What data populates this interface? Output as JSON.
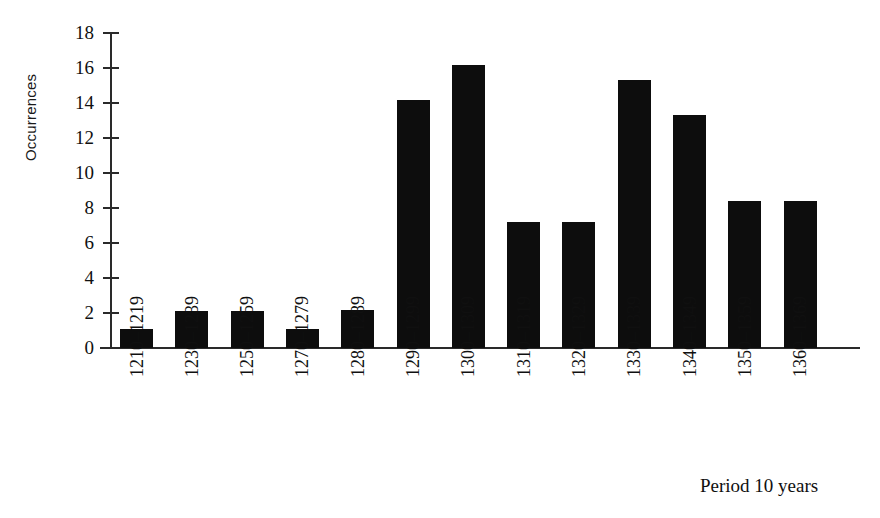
{
  "chart_data": {
    "type": "bar",
    "title": "",
    "xlabel": "Period 10 years",
    "ylabel": "Occurrences",
    "categories": [
      "1210–1219",
      "1230–1239",
      "1250–1259",
      "1270–1279",
      "1280–1289",
      "1290–1299",
      "1300–1309",
      "1310–1319",
      "1320–1329",
      "1330–1339",
      "1340–1349",
      "1350–1359",
      "1360–1369"
    ],
    "values": [
      1.1,
      2.1,
      2.1,
      1.1,
      2.2,
      14.2,
      16.2,
      7.2,
      7.2,
      15.3,
      13.3,
      8.4,
      8.4
    ],
    "ylim": [
      0,
      18
    ],
    "ytick_values": [
      0,
      2,
      4,
      6,
      8,
      10,
      12,
      14,
      16,
      18
    ],
    "ytick_labels": [
      "0",
      "2",
      "4",
      "6",
      "8",
      "10",
      "12",
      "14",
      "16",
      "18"
    ],
    "grid": false,
    "legend": false,
    "bar_color": "#0d0d0d",
    "axis_color": "#2a2a2a"
  }
}
